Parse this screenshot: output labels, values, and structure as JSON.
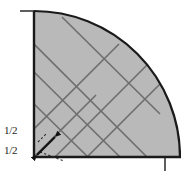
{
  "figure": {
    "background_color": "#ffffff",
    "fill_color": "#b9b9b9",
    "outline_color": "#1a1a1a",
    "inner_line_color": "#6e6e6e",
    "arrow_color": "#111111",
    "labels": [
      {
        "id": "label-upper",
        "text": "1/2",
        "x": 4,
        "y": 130
      },
      {
        "id": "label-lower",
        "text": "1/2",
        "x": 4,
        "y": 150
      }
    ],
    "geometry": {
      "origin": {
        "x": 34,
        "y": 157
      },
      "radius": 146,
      "arc_top": {
        "x": 34,
        "y": 11
      },
      "arc_right": {
        "x": 165,
        "y": 157
      },
      "axis_top_tick": {
        "x1": 20,
        "y1": 11,
        "x2": 34,
        "y2": 11
      },
      "axis_right_tick": {
        "x1": 165,
        "y1": 157,
        "x2": 165,
        "y2": 171
      }
    },
    "inner_lines": [
      {
        "id": "diag-a1",
        "x1": 34,
        "y1": 72,
        "x2": 120,
        "y2": 157
      },
      {
        "id": "diag-a2",
        "x1": 34,
        "y1": 104,
        "x2": 88,
        "y2": 157
      },
      {
        "id": "diag-a3",
        "x1": 62,
        "y1": 17,
        "x2": 160,
        "y2": 114
      },
      {
        "id": "diag-a4",
        "x1": 34,
        "y1": 44,
        "x2": 147,
        "y2": 157
      },
      {
        "id": "diag-b1",
        "x1": 34,
        "y1": 129,
        "x2": 119,
        "y2": 44
      },
      {
        "id": "diag-b2",
        "x1": 55,
        "y1": 157,
        "x2": 152,
        "y2": 60
      },
      {
        "id": "diag-b3",
        "x1": 87,
        "y1": 157,
        "x2": 163,
        "y2": 81
      },
      {
        "id": "diag-b4",
        "x1": 34,
        "y1": 157,
        "x2": 96,
        "y2": 95
      }
    ],
    "arrow": {
      "id": "double-headed-arrow",
      "x1": 36,
      "y1": 155,
      "x2": 56,
      "y2": 136
    },
    "dashed_marks": [
      {
        "id": "dash-1",
        "x1": 40,
        "y1": 152,
        "x2": 64,
        "y2": 160
      },
      {
        "id": "dash-2",
        "x1": 38,
        "y1": 141,
        "x2": 46,
        "y2": 133
      }
    ]
  }
}
